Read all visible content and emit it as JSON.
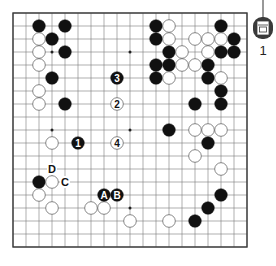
{
  "diagram": {
    "type": "go-board",
    "size": 19,
    "origin": {
      "x": 13,
      "y": 13
    },
    "spacing": 13,
    "stone_radius": 6.3,
    "colors": {
      "line": "#7a7a7a",
      "border": "#3a3a3a",
      "black_stone": "#111111",
      "white_stone": "#ffffff",
      "white_stone_edge": "#555555",
      "background": "#ffffff"
    },
    "hoshi": [
      [
        3,
        3
      ],
      [
        9,
        3
      ],
      [
        3,
        9
      ],
      [
        9,
        9
      ],
      [
        15,
        9
      ],
      [
        3,
        15
      ],
      [
        9,
        15
      ],
      [
        15,
        15
      ],
      [
        15,
        3
      ]
    ],
    "black_stones": [
      [
        2,
        1
      ],
      [
        4,
        1
      ],
      [
        3,
        2
      ],
      [
        4,
        3
      ],
      [
        3,
        5
      ],
      [
        4,
        7
      ],
      [
        11,
        1
      ],
      [
        16,
        1
      ],
      [
        11,
        2
      ],
      [
        17,
        2
      ],
      [
        12,
        3
      ],
      [
        16,
        3
      ],
      [
        17,
        3
      ],
      [
        11,
        4
      ],
      [
        12,
        4
      ],
      [
        15,
        4
      ],
      [
        11,
        5
      ],
      [
        15,
        5
      ],
      [
        16,
        6
      ],
      [
        14,
        7
      ],
      [
        16,
        7
      ],
      [
        12,
        9
      ],
      [
        15,
        10
      ],
      [
        16,
        14
      ],
      [
        15,
        15
      ],
      [
        14,
        16
      ],
      [
        2,
        13
      ]
    ],
    "white_stones": [
      [
        2,
        2
      ],
      [
        2,
        3
      ],
      [
        2,
        4
      ],
      [
        2,
        6
      ],
      [
        2,
        7
      ],
      [
        12,
        1
      ],
      [
        12,
        2
      ],
      [
        14,
        2
      ],
      [
        15,
        2
      ],
      [
        16,
        2
      ],
      [
        13,
        3
      ],
      [
        15,
        3
      ],
      [
        13,
        4
      ],
      [
        14,
        4
      ],
      [
        12,
        5
      ],
      [
        16,
        5
      ],
      [
        14,
        9
      ],
      [
        15,
        9
      ],
      [
        16,
        9
      ],
      [
        14,
        11
      ],
      [
        16,
        12
      ],
      [
        12,
        16
      ],
      [
        3,
        10
      ],
      [
        3,
        13
      ],
      [
        2,
        14
      ],
      [
        3,
        15
      ],
      [
        6,
        15
      ],
      [
        7,
        15
      ],
      [
        9,
        16
      ]
    ],
    "numbered_moves": [
      {
        "n": "1",
        "color": "black",
        "col": 5,
        "row": 10
      },
      {
        "n": "2",
        "color": "white",
        "col": 8,
        "row": 7
      },
      {
        "n": "3",
        "color": "black",
        "col": 8,
        "row": 5
      },
      {
        "n": "4",
        "color": "white",
        "col": 8,
        "row": 10
      }
    ],
    "lettered_stones": [
      {
        "letter": "A",
        "color": "black",
        "col": 7,
        "row": 14
      },
      {
        "letter": "B",
        "color": "black",
        "col": 8,
        "row": 14
      }
    ],
    "board_labels": [
      {
        "letter": "C",
        "col": 4,
        "row": 13
      },
      {
        "letter": "D",
        "col": 3,
        "row": 12
      }
    ]
  },
  "badge": {
    "icon": "book-icon",
    "number": "1"
  }
}
